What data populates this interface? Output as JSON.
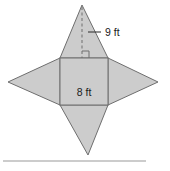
{
  "figure": {
    "shape_name": "square with four triangles",
    "fill_color": "#cccccc",
    "stroke_color": "#6e6e6e",
    "label_color": "#1a1a1a",
    "rule_color": "#9a9a9a",
    "labels": {
      "height_label": "9 ft",
      "base_label": "8 ft"
    },
    "measurements": {
      "square_side_value": 8,
      "square_side_unit": "ft",
      "triangle_height_value": 9,
      "triangle_height_unit": "ft"
    },
    "square": {
      "left": 60,
      "top": 58,
      "right": 108,
      "bottom": 105
    },
    "apexes": {
      "top": {
        "x": 82,
        "y": 5
      },
      "bottom": {
        "x": 88,
        "y": 155
      },
      "left": {
        "x": 8,
        "y": 82
      },
      "right": {
        "x": 158,
        "y": 82
      }
    },
    "height_line": {
      "x": 82,
      "y_top": 7,
      "y_bottom": 58,
      "style": "dashed"
    },
    "right_angle_marker": {
      "x": 82,
      "y": 58,
      "size": 7
    },
    "leader_line": {
      "x1": 88,
      "y1": 32,
      "x2": 101,
      "y2": 32
    },
    "baseline_rule": {
      "x1": 3,
      "x2": 146,
      "y": 161
    }
  }
}
